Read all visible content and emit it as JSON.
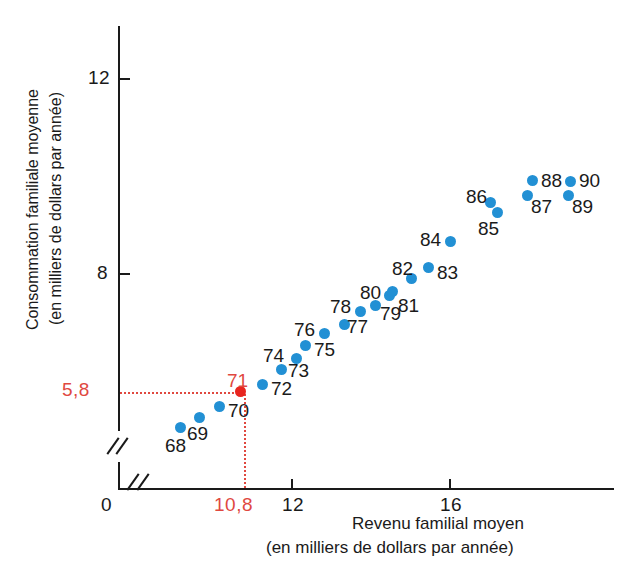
{
  "chart_data": {
    "type": "scatter",
    "title": "",
    "xlabel": "Revenu familial moyen",
    "xlabel_sub": "(en milliers de dollars par année)",
    "ylabel": "Consommation familiale moyenne",
    "ylabel_sub": "(en milliers de dollars par année)",
    "x_ticks": [
      "0",
      "12",
      "16"
    ],
    "y_ticks": [
      "12",
      "8"
    ],
    "origin_label": "0",
    "grid": false,
    "legend": null,
    "axis_break": true,
    "highlight": {
      "label": "71",
      "x_value": "10,8",
      "y_value": "5,8",
      "color": "#e8251f"
    },
    "point_color": "#2290d4",
    "points": [
      {
        "label": "68",
        "px": 180,
        "py": 427,
        "lx": 165,
        "ly": 435,
        "color": "#2290d4"
      },
      {
        "label": "69",
        "px": 199,
        "py": 417,
        "lx": 187,
        "ly": 423,
        "color": "#2290d4"
      },
      {
        "label": "70",
        "px": 219,
        "py": 406,
        "lx": 228,
        "ly": 400,
        "color": "#2290d4"
      },
      {
        "label": "71",
        "px": 240,
        "py": 391,
        "lx": 227,
        "ly": 370,
        "color": "#e8251f"
      },
      {
        "label": "72",
        "px": 262,
        "py": 384,
        "lx": 271,
        "ly": 378,
        "color": "#2290d4"
      },
      {
        "label": "73",
        "px": 281,
        "py": 369,
        "lx": 288,
        "ly": 360,
        "color": "#2290d4"
      },
      {
        "label": "74",
        "px": 296,
        "py": 358,
        "lx": 263,
        "ly": 345,
        "color": "#2290d4"
      },
      {
        "label": "75",
        "px": 305,
        "py": 345,
        "lx": 314,
        "ly": 339,
        "color": "#2290d4"
      },
      {
        "label": "76",
        "px": 324,
        "py": 333,
        "lx": 294,
        "ly": 319,
        "color": "#2290d4"
      },
      {
        "label": "77",
        "px": 344,
        "py": 324,
        "lx": 347,
        "ly": 316,
        "color": "#2290d4"
      },
      {
        "label": "78",
        "px": 360,
        "py": 311,
        "lx": 330,
        "ly": 296,
        "color": "#2290d4"
      },
      {
        "label": "79",
        "px": 375,
        "py": 305,
        "lx": 380,
        "ly": 303,
        "color": "#2290d4"
      },
      {
        "label": "80",
        "px": 389,
        "py": 295,
        "lx": 360,
        "ly": 282,
        "color": "#2290d4"
      },
      {
        "label": "81",
        "px": 392,
        "py": 291,
        "lx": 398,
        "ly": 295,
        "color": "#2290d4"
      },
      {
        "label": "82",
        "px": 411,
        "py": 278,
        "lx": 392,
        "ly": 258,
        "color": "#2290d4"
      },
      {
        "label": "83",
        "px": 428,
        "py": 267,
        "lx": 437,
        "ly": 262,
        "color": "#2290d4"
      },
      {
        "label": "84",
        "px": 450,
        "py": 241,
        "lx": 420,
        "ly": 229,
        "color": "#2290d4"
      },
      {
        "label": "85",
        "px": 497,
        "py": 212,
        "lx": 478,
        "ly": 218,
        "color": "#2290d4"
      },
      {
        "label": "86",
        "px": 490,
        "py": 202,
        "lx": 466,
        "ly": 186,
        "color": "#2290d4"
      },
      {
        "label": "87",
        "px": 527,
        "py": 195,
        "lx": 531,
        "ly": 196,
        "color": "#2290d4"
      },
      {
        "label": "88",
        "px": 532,
        "py": 180,
        "lx": 541,
        "ly": 170,
        "color": "#2290d4"
      },
      {
        "label": "89",
        "px": 568,
        "py": 195,
        "lx": 572,
        "ly": 196,
        "color": "#2290d4"
      },
      {
        "label": "90",
        "px": 570,
        "py": 181,
        "lx": 579,
        "ly": 170,
        "color": "#2290d4"
      }
    ]
  },
  "axes": {
    "x_tick_12": "12",
    "x_tick_16": "16",
    "x_tick_red": "10,8",
    "y_tick_12": "12",
    "y_tick_8": "8",
    "y_tick_red": "5,8",
    "origin": "0"
  }
}
